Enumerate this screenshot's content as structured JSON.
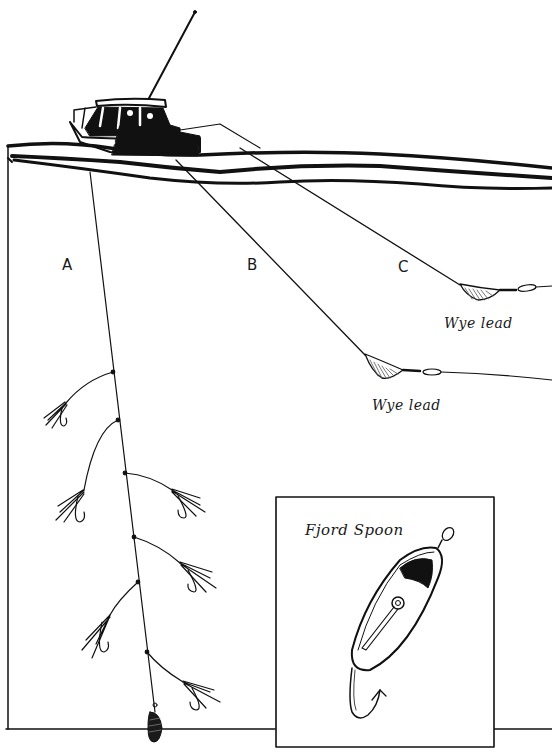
{
  "diagram": {
    "colors": {
      "ink": "#111111",
      "background": "#ffffff",
      "hatch": "#555555"
    },
    "rigs": [
      {
        "id": "A",
        "label": "A",
        "description": "Vertical line with five dropper flies and a bottom sinker"
      },
      {
        "id": "B",
        "label": "B",
        "weight_label": "Wye lead"
      },
      {
        "id": "C",
        "label": "C",
        "weight_label": "Wye lead"
      }
    ],
    "inset": {
      "title": "Fjord Spoon"
    },
    "elements": {
      "boat": "boat-icon",
      "antenna": "antenna-icon",
      "water_surface": "waves",
      "sinker": "sinker-icon",
      "fly": "fly-hook-icon",
      "spoon": "spoon-lure-icon"
    }
  }
}
